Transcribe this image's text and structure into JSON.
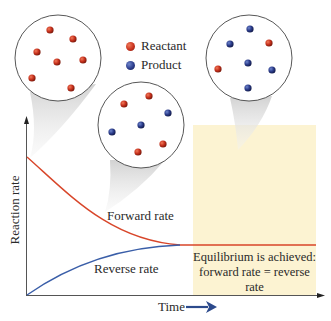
{
  "figure": {
    "legend": [
      {
        "label": "Reactant",
        "color": "#c8321e"
      },
      {
        "label": "Product",
        "color": "#2c3d8c"
      }
    ],
    "axes": {
      "ylabel": "Reaction rate",
      "xlabel": "Time"
    },
    "curves": {
      "forward_label": "Forward rate",
      "reverse_label": "Reverse rate",
      "forward_color": "#d8462a",
      "reverse_color": "#3a5ea8"
    },
    "equilibrium": {
      "line1": "Equilibrium is achieved:",
      "line2": "forward rate = reverse rate",
      "region_color": "#fcf3d2"
    },
    "insets": [
      {
        "name": "start",
        "reactants": 7,
        "products": 0
      },
      {
        "name": "middle",
        "reactants": 4,
        "products": 3
      },
      {
        "name": "equilibrium",
        "reactants": 2,
        "products": 5
      }
    ]
  }
}
